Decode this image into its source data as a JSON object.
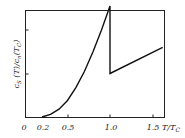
{
  "chart_data": {
    "type": "line",
    "title": "",
    "xlabel": "T/T_C",
    "ylabel": "c_s(T)/c_n(T_c)",
    "xlim": [
      0,
      1.65
    ],
    "ylim": [
      0,
      2.7
    ],
    "x_ticks": [
      "0",
      "0.2",
      "0.5",
      "1.0",
      "1.5"
    ],
    "y_ticks": [
      1,
      2
    ],
    "y_tick_labels_shown": false,
    "grid": false,
    "legend": null,
    "series": [
      {
        "name": "superconducting specific heat",
        "x": [
          0.2,
          0.3,
          0.4,
          0.5,
          0.6,
          0.7,
          0.8,
          0.9,
          1.0,
          1.0,
          1.62
        ],
        "y": [
          0.0,
          0.06,
          0.18,
          0.38,
          0.68,
          1.05,
          1.5,
          2.0,
          2.55,
          1.0,
          1.6
        ]
      }
    ]
  },
  "labels": {
    "x0": "0",
    "x1": "0.2",
    "x2": "0.5",
    "x3": "1.0",
    "x4": "1.5",
    "xlabel_T": "T/T",
    "xlabel_sub": "C",
    "ylabel_main": "c",
    "ylabel_sub_s": "S",
    "ylabel_mid": " (T)/c",
    "ylabel_sub_n": "n",
    "ylabel_end": "(T",
    "ylabel_sub_c": "C",
    "ylabel_close": ")"
  }
}
